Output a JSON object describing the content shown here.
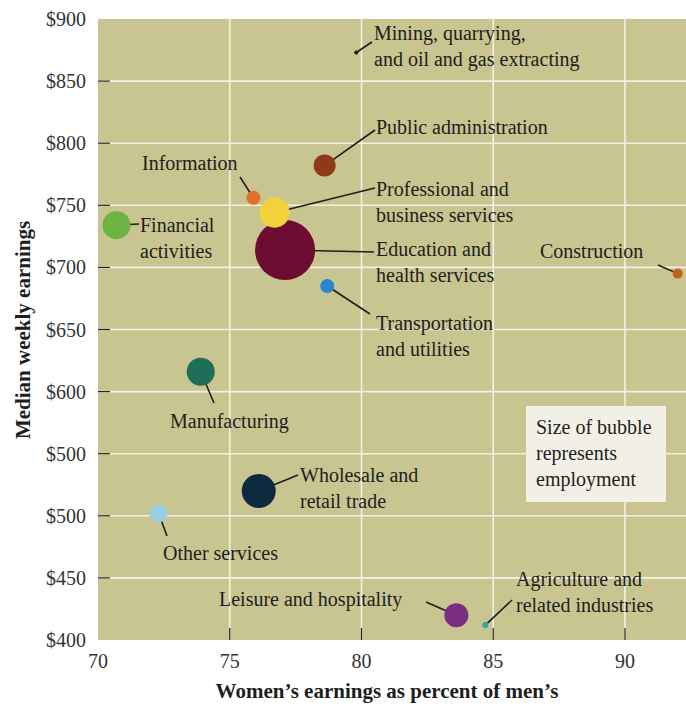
{
  "chart_data": {
    "type": "scatter",
    "subtype": "bubble",
    "title": "Median weekly earnings, by industry",
    "xlabel": "Women’s earnings as percent of men’s",
    "ylabel": "Median weekly earnings",
    "xlim": [
      70,
      92.2
    ],
    "ylim": [
      400,
      900
    ],
    "x_ticks": [
      70,
      75,
      80,
      85,
      90
    ],
    "x_tick_labels": [
      "70",
      "75",
      "80",
      "85",
      "90"
    ],
    "y_ticks": [
      900,
      850,
      800,
      750,
      700,
      650,
      600,
      550,
      500,
      450,
      400
    ],
    "y_tick_labels": [
      "$900",
      "$850",
      "$800",
      "$750",
      "$700",
      "$650",
      "$600",
      "$500",
      "$500",
      "$450",
      "$400"
    ],
    "grid": true,
    "background": "#c8c590",
    "grid_color": "#f4f2e4",
    "legend_note": [
      "Size of bubble",
      "represents",
      "employment"
    ],
    "points": [
      {
        "name": "Mining, quarrying, and oil and gas extracting",
        "label_lines": [
          "Mining, quarrying,",
          "and oil and gas extracting"
        ],
        "x": 79.8,
        "y": 873,
        "r": 2,
        "color": "#1a1a1a",
        "label_x": 374,
        "label_y": 40,
        "anchor": "start",
        "line_to": [
          372,
          42
        ]
      },
      {
        "name": "Public administration",
        "label_lines": [
          "Public administration"
        ],
        "x": 78.6,
        "y": 782,
        "r": 11,
        "color": "#8c3a17",
        "label_x": 376,
        "label_y": 134,
        "anchor": "start",
        "line_to": [
          375,
          130
        ]
      },
      {
        "name": "Information",
        "label_lines": [
          "Information"
        ],
        "x": 75.9,
        "y": 756,
        "r": 7,
        "color": "#e0702a",
        "label_x": 142,
        "label_y": 170,
        "anchor": "start",
        "line_to": [
          240,
          177
        ]
      },
      {
        "name": "Professional and business services",
        "label_lines": [
          "Professional and",
          "business services"
        ],
        "x": 76.7,
        "y": 744,
        "r": 15,
        "color": "#f2d23a",
        "label_x": 376,
        "label_y": 196,
        "anchor": "start",
        "line_to": [
          375,
          188
        ]
      },
      {
        "name": "Education and health services",
        "label_lines": [
          "Education and",
          "health services"
        ],
        "x": 77.1,
        "y": 714,
        "r": 30,
        "color": "#6e0d32",
        "label_x": 376,
        "label_y": 256,
        "anchor": "start",
        "line_to": [
          374,
          252
        ]
      },
      {
        "name": "Financial activities",
        "label_lines": [
          "Financial",
          "activities"
        ],
        "x": 70.7,
        "y": 734,
        "r": 14,
        "color": "#6db33f",
        "label_x": 140,
        "label_y": 232,
        "anchor": "start",
        "line_to": [
          139,
          224
        ]
      },
      {
        "name": "Transportation and utilities",
        "label_lines": [
          "Transportation",
          "and utilities"
        ],
        "x": 78.7,
        "y": 685,
        "r": 7,
        "color": "#2a86cc",
        "label_x": 376,
        "label_y": 330,
        "anchor": "start",
        "line_to": [
          370,
          314
        ]
      },
      {
        "name": "Construction",
        "label_lines": [
          "Construction"
        ],
        "x": 92.0,
        "y": 695,
        "r": 5,
        "color": "#b8641c",
        "label_x": 540,
        "label_y": 258,
        "anchor": "start",
        "line_to": [
          658,
          265
        ]
      },
      {
        "name": "Manufacturing",
        "label_lines": [
          "Manufacturing"
        ],
        "x": 73.9,
        "y": 616,
        "r": 14,
        "color": "#1f6e5a",
        "label_x": 170,
        "label_y": 428,
        "anchor": "start",
        "line_to": [
          214,
          403
        ]
      },
      {
        "name": "Wholesale and retail trade",
        "label_lines": [
          "Wholesale and",
          "retail trade"
        ],
        "x": 76.1,
        "y": 520,
        "r": 17,
        "color": "#0e2a3f",
        "label_x": 300,
        "label_y": 482,
        "anchor": "start",
        "line_to": [
          298,
          475
        ]
      },
      {
        "name": "Other services",
        "label_lines": [
          "Other services"
        ],
        "x": 72.3,
        "y": 502,
        "r": 9,
        "color": "#9ccde0",
        "label_x": 163,
        "label_y": 560,
        "anchor": "start",
        "line_to": [
          167,
          536
        ]
      },
      {
        "name": "Leisure and hospitality",
        "label_lines": [
          "Leisure and hospitality"
        ],
        "x": 83.6,
        "y": 420,
        "r": 12,
        "color": "#7b2d82",
        "label_x": 219,
        "label_y": 606,
        "anchor": "start",
        "line_to": [
          426,
          602
        ]
      },
      {
        "name": "Agriculture and related industries",
        "label_lines": [
          "Agriculture and",
          "related industries"
        ],
        "x": 84.7,
        "y": 412,
        "r": 3,
        "color": "#2aa8a8",
        "label_x": 516,
        "label_y": 586,
        "anchor": "start",
        "line_to": [
          512,
          600
        ]
      }
    ]
  }
}
